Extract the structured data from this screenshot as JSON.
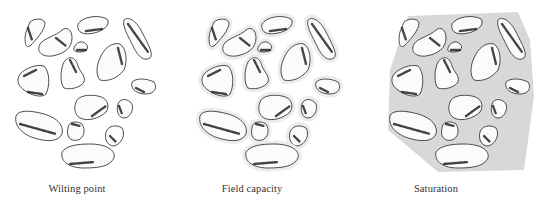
{
  "figure": {
    "panels": [
      {
        "id": "wilting-point",
        "label": "Wilting point",
        "offset_x": 0,
        "caption_x": 77,
        "water": "none"
      },
      {
        "id": "field-capacity",
        "label": "Field capacity",
        "offset_x": 180,
        "caption_x": 252,
        "water": "film"
      },
      {
        "id": "saturation",
        "label": "Saturation",
        "offset_x": 358,
        "caption_x": 436,
        "water": "full"
      }
    ],
    "colors": {
      "outline": "#3a3a3a",
      "particle_fill": "#fbfbfb",
      "film": "#ececec",
      "saturated": "#d8d8d8",
      "stipple": "#222222",
      "caption": "#333333"
    },
    "particles": [
      {
        "d": "M26,22 C30,18 40,18 41,23 C41,30 32,40 26,46 C21,49 20,40 22,32 Z",
        "shade": "M24,28 L28,40"
      },
      {
        "d": "M36,44 C40,38 52,36 58,30 C63,26 68,30 68,38 C68,48 60,54 48,56 C38,57 32,52 36,44 Z",
        "shade": "M52,38 L62,46"
      },
      {
        "d": "M74,24 C78,17 94,14 103,19 C107,24 100,31 90,33 C82,35 72,34 74,24 Z",
        "shade": "M82,31 L98,29"
      },
      {
        "d": "M70,48 C72,42 78,40 82,44 C86,48 82,52 76,52 C71,52 69,51 70,48 Z",
        "shade": "M73,50 L82,50"
      },
      {
        "d": "M120,20 C124,16 132,20 138,32 C144,44 150,54 146,58 C140,62 134,56 130,48 C124,36 118,26 120,20 Z",
        "shade": "M124,24 L144,52"
      },
      {
        "d": "M60,62 C66,54 72,58 74,66 C76,72 82,76 80,82 C76,88 66,90 60,88 C56,84 56,70 60,62 Z",
        "shade": "M66,60 L72,72"
      },
      {
        "d": "M96,58 C100,48 108,42 116,44 C122,48 124,60 120,70 C114,78 104,82 96,80 C92,76 92,66 96,58 Z",
        "shade": "M114,48 L118,64"
      },
      {
        "d": "M16,74 C22,68 32,64 40,66 C46,72 46,86 42,94 C38,98 28,96 20,90 C14,86 12,80 16,74 Z",
        "shade": "M20,76 L32,70 M24,92 L38,94"
      },
      {
        "d": "M128,82 C132,78 142,78 150,82 C154,88 150,94 142,94 C134,94 126,90 128,82 Z",
        "shade": "M132,88 L140,92"
      },
      {
        "d": "M72,102 C74,96 84,94 94,96 C104,98 106,106 102,112 C96,118 84,122 76,118 C70,114 70,108 72,102 Z",
        "shade": "M88,116 L102,106"
      },
      {
        "d": "M114,104 C116,98 124,98 128,104 C130,110 126,118 120,118 C114,118 112,110 114,104 Z",
        "shade": "M115,106 L118,114"
      },
      {
        "d": "M12,116 C14,110 26,110 40,114 C54,118 60,126 58,134 C54,142 44,142 30,138 C18,134 10,126 12,116 Z",
        "shade": "M16,124 L52,134"
      },
      {
        "d": "M64,128 C64,122 72,120 78,124 C82,130 80,138 74,140 C66,142 62,136 64,128 Z",
        "shade": "M68,124 L76,126"
      },
      {
        "d": "M102,132 C104,126 112,124 118,128 C122,134 118,144 110,146 C104,146 100,140 102,132 Z",
        "shade": "M106,136 L112,142"
      },
      {
        "d": "M58,152 C62,146 72,144 86,144 C102,144 112,150 110,158 C106,166 96,168 80,168 C66,168 56,162 58,152 Z",
        "shade": "M66,164 L90,162"
      }
    ],
    "saturated_region": "M30,16 L140,12 L152,40 L156,96 L146,170 L60,172 L34,150 L10,130 L12,70 Z"
  }
}
